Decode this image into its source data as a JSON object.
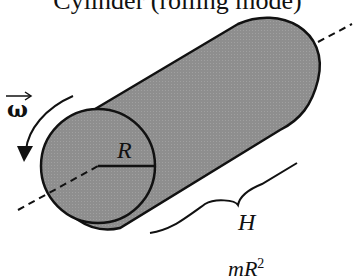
{
  "title": "Cylinder (rolling mode)",
  "labels": {
    "omega": "ω",
    "radius": "R",
    "height": "H"
  },
  "formula": {
    "text": "mR",
    "exponent": "2"
  },
  "colors": {
    "fill": "#8c8c8c",
    "stroke": "#111111"
  }
}
